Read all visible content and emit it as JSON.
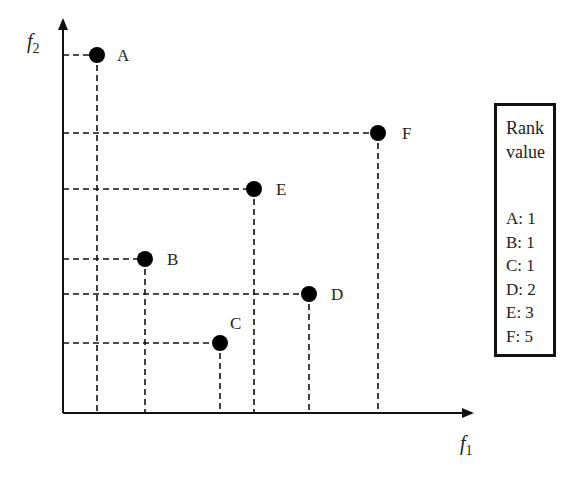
{
  "chart_data": {
    "type": "scatter",
    "title": "",
    "xlabel": "f1",
    "ylabel": "f2",
    "grid": false,
    "points": [
      {
        "label": "A",
        "x": 97,
        "y": 55,
        "rank": 1
      },
      {
        "label": "B",
        "x": 145,
        "y": 259,
        "rank": 1
      },
      {
        "label": "C",
        "x": 220,
        "y": 343,
        "rank": 1
      },
      {
        "label": "D",
        "x": 309,
        "y": 294,
        "rank": 2
      },
      {
        "label": "E",
        "x": 254,
        "y": 189,
        "rank": 3
      },
      {
        "label": "F",
        "x": 378,
        "y": 133,
        "rank": 5
      }
    ],
    "annotations": "Dashed projection lines from each point to both axes",
    "legend_position": "right"
  },
  "axes": {
    "x_label": "f",
    "x_sub": "1",
    "y_label": "f",
    "y_sub": "2"
  },
  "rank_box": {
    "title_line1": "Rank",
    "title_line2": "value",
    "entries": [
      "A: 1",
      "B: 1",
      "C: 1",
      "D: 2",
      "E: 3",
      "F: 5"
    ]
  },
  "colors": {
    "ink": "#111111",
    "background": "#ffffff"
  }
}
